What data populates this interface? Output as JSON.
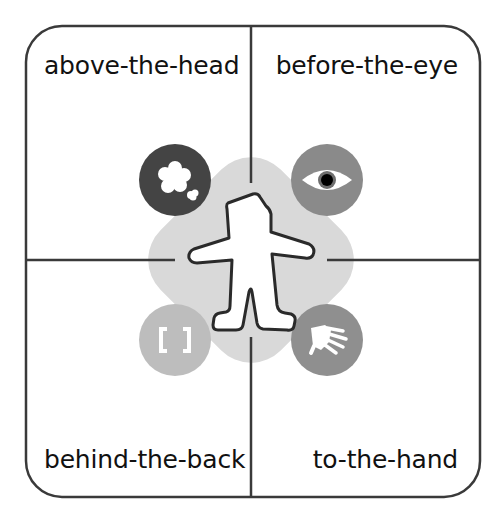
{
  "diagram": {
    "type": "quadrant-diagram",
    "quadrants": [
      {
        "position": "top-left",
        "label": "above-the-head",
        "icon": "thought-cloud-icon",
        "circle_color": "#444444"
      },
      {
        "position": "top-right",
        "label": "before-the-eye",
        "icon": "eye-icon",
        "circle_color": "#8a8a8a"
      },
      {
        "position": "bottom-left",
        "label": "behind-the-back",
        "icon": "brackets-icon",
        "circle_color": "#bdbdbd"
      },
      {
        "position": "bottom-right",
        "label": "to-the-hand",
        "icon": "hand-icon",
        "circle_color": "#8f8f8f"
      }
    ],
    "center": {
      "figure": "person-silhouette-icon",
      "background_color": "#d9d9d9"
    },
    "colors": {
      "frame": "#3a3a3a",
      "text": "#111111",
      "backdrop": "#d9d9d9",
      "figure_fill": "#ffffff"
    }
  }
}
